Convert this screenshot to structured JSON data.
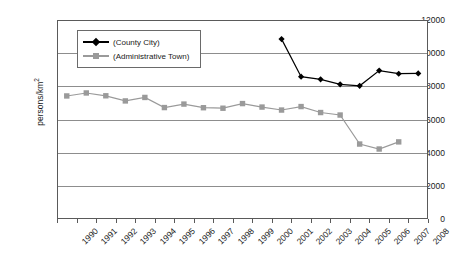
{
  "chart_data": {
    "type": "line",
    "title": "",
    "xlabel": "",
    "ylabel": "persons/km²",
    "ylim": [
      0,
      12000
    ],
    "ytick_values": [
      0,
      2000,
      4000,
      6000,
      8000,
      10000,
      12000
    ],
    "ytick_labels": [
      "0",
      "2000",
      "4000",
      "6000",
      "8000",
      "10000",
      "12000"
    ],
    "grid": true,
    "legend_position": "upper-left-inside",
    "categories": [
      "1990",
      "1991",
      "1992",
      "1993",
      "1994",
      "1995",
      "1996",
      "1997",
      "1998",
      "1999",
      "2000",
      "2001",
      "2002",
      "2003",
      "2004",
      "2005",
      "2006",
      "2007",
      "2008"
    ],
    "series": [
      {
        "name": "(County City)",
        "color": "#000000",
        "marker": "diamond",
        "values": [
          null,
          null,
          null,
          null,
          null,
          null,
          null,
          null,
          null,
          null,
          null,
          10850,
          8580,
          8420,
          8120,
          8030,
          8950,
          8760,
          8780
        ]
      },
      {
        "name": "(Administrative Town)",
        "color": "#9a9a9a",
        "marker": "square",
        "values": [
          7420,
          7600,
          7430,
          7120,
          7330,
          6720,
          6930,
          6710,
          6680,
          6960,
          6750,
          6570,
          6780,
          6420,
          6270,
          4520,
          4220,
          4650,
          null
        ]
      }
    ]
  },
  "legend": {
    "items": [
      {
        "label": "(County City)"
      },
      {
        "label": "(Administrative Town)"
      }
    ]
  },
  "axes": {
    "y_title": "persons/km",
    "y_title_exponent": "2"
  }
}
